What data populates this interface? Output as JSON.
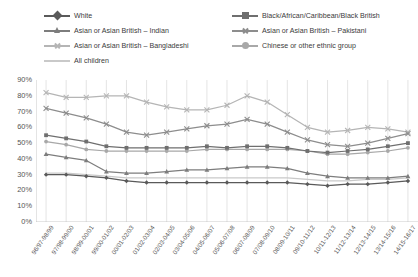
{
  "chart_data": {
    "type": "line",
    "title": "",
    "xlabel": "",
    "ylabel": "",
    "ylim": [
      0,
      90
    ],
    "ytick_labels": [
      "90%",
      "80%",
      "70%",
      "60%",
      "50%",
      "40%",
      "30%",
      "20%",
      "10%",
      "0%"
    ],
    "ytick_values": [
      90,
      80,
      70,
      60,
      50,
      40,
      30,
      20,
      10,
      0
    ],
    "grid": "vertical",
    "legend_position": "top",
    "categories": [
      "96/97-98/99",
      "97/98-99/00",
      "98/99-00/01",
      "99/00-01/02",
      "00/01-02/03",
      "01/02-03/04",
      "02/03-04/05",
      "03/04-05/06",
      "04/05-06/07",
      "05/06-07/08",
      "06/07-08/09",
      "07/08-09/10",
      "08/09-10/11",
      "09/10-11/12",
      "10/11-12/13",
      "11/12-13/14",
      "12/13-14/15",
      "13/14-15/16",
      "14/15-16/17"
    ],
    "series": [
      {
        "name": "White",
        "color": "#5a5a5a",
        "marker": "diamond",
        "values": [
          30,
          30,
          29,
          28,
          26,
          25,
          25,
          25,
          25,
          25,
          25,
          25,
          25,
          24,
          23,
          24,
          24,
          25,
          26
        ]
      },
      {
        "name": "Black/African/Caribbean/Black British",
        "color": "#6f6f6f",
        "marker": "square",
        "values": [
          55,
          53,
          51,
          48,
          47,
          47,
          47,
          47,
          48,
          47,
          48,
          48,
          47,
          45,
          44,
          45,
          46,
          48,
          50
        ]
      },
      {
        "name": "Asian or Asian British – Indian",
        "color": "#7d7d7d",
        "marker": "triangle",
        "values": [
          43,
          41,
          39,
          32,
          31,
          31,
          32,
          33,
          33,
          34,
          35,
          35,
          34,
          31,
          29,
          28,
          28,
          28,
          29
        ]
      },
      {
        "name": "Asian or Asian British – Pakistani",
        "color": "#8d8d8d",
        "marker": "x",
        "values": [
          72,
          69,
          66,
          62,
          57,
          55,
          57,
          59,
          61,
          62,
          65,
          62,
          57,
          52,
          49,
          48,
          50,
          53,
          56
        ]
      },
      {
        "name": "Asian or Asian British – Bangladeshi",
        "color": "#b5b5b5",
        "marker": "x",
        "values": [
          82,
          79,
          79,
          80,
          80,
          76,
          73,
          71,
          71,
          74,
          80,
          76,
          68,
          60,
          57,
          58,
          60,
          59,
          57
        ]
      },
      {
        "name": "Chinese or other ethnic group",
        "color": "#a8a8a8",
        "marker": "circle",
        "values": [
          51,
          49,
          46,
          45,
          45,
          45,
          45,
          45,
          46,
          46,
          46,
          46,
          46,
          45,
          43,
          43,
          44,
          45,
          47
        ]
      },
      {
        "name": "All children",
        "color": "#c9c9c9",
        "marker": "line",
        "values": [
          31,
          31,
          30,
          29,
          28,
          28,
          28,
          28,
          28,
          28,
          28,
          28,
          28,
          27,
          26,
          26,
          27,
          27,
          28
        ]
      }
    ]
  },
  "legend": {
    "items": [
      {
        "label": "White",
        "column": 1,
        "row": 0
      },
      {
        "label": "Black/African/Caribbean/Black British",
        "column": 2,
        "row": 0
      },
      {
        "label": "Asian or Asian British – Indian",
        "column": 1,
        "row": 1
      },
      {
        "label": "Asian or Asian British – Pakistani",
        "column": 2,
        "row": 1
      },
      {
        "label": "Asian or Asian British – Bangladeshi",
        "column": 1,
        "row": 2
      },
      {
        "label": "Chinese or other ethnic group",
        "column": 2,
        "row": 2
      },
      {
        "label": "All children",
        "column": 1,
        "row": 3
      }
    ]
  }
}
